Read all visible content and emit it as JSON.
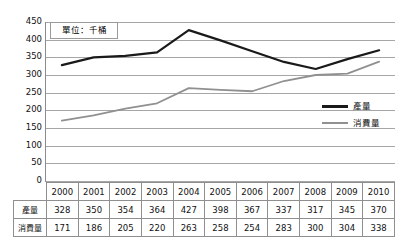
{
  "chart_data": {
    "type": "line",
    "title": "",
    "annotation": "單位：千桶",
    "xlabel": "",
    "ylabel": "",
    "ylim": [
      0,
      450
    ],
    "ystep": 50,
    "grid": true,
    "legend_position": "right",
    "categories": [
      "2000",
      "2001",
      "2002",
      "2003",
      "2004",
      "2005",
      "2006",
      "2007",
      "2008",
      "2009",
      "2010"
    ],
    "yticks": [
      "450",
      "400",
      "350",
      "300",
      "250",
      "200",
      "150",
      "100",
      "50",
      "0"
    ],
    "series": [
      {
        "name": "產量",
        "color": "#1a1a1a",
        "values": [
          328,
          350,
          354,
          364,
          427,
          398,
          367,
          337,
          317,
          345,
          370
        ]
      },
      {
        "name": "消費量",
        "color": "#909090",
        "values": [
          171,
          186,
          205,
          220,
          263,
          258,
          254,
          283,
          300,
          304,
          338
        ]
      }
    ]
  },
  "legend": {
    "items": [
      {
        "label": "產量"
      },
      {
        "label": "消費量"
      }
    ]
  },
  "table": {
    "header": [
      "2000",
      "2001",
      "2002",
      "2003",
      "2004",
      "2005",
      "2006",
      "2007",
      "2008",
      "2009",
      "2010"
    ],
    "rows": [
      {
        "label": "產量",
        "values": [
          "328",
          "350",
          "354",
          "364",
          "427",
          "398",
          "367",
          "337",
          "317",
          "345",
          "370"
        ]
      },
      {
        "label": "消費量",
        "values": [
          "171",
          "186",
          "205",
          "220",
          "263",
          "258",
          "254",
          "283",
          "300",
          "304",
          "338"
        ]
      }
    ]
  },
  "colors": {
    "production_line": "#1a1a1a",
    "consumption_line": "#909090",
    "gridline": "#a6a6a6",
    "border": "#8f8f8f"
  }
}
